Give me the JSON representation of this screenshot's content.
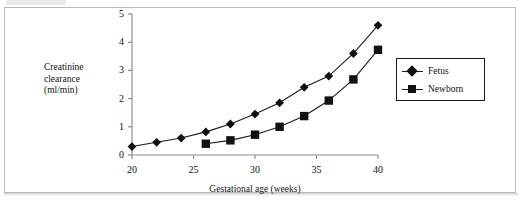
{
  "figure": {
    "top_sliver_text": "",
    "frame_color": "#b9b9b9"
  },
  "chart_data": {
    "type": "line",
    "title": "",
    "subtitle": "",
    "xlabel": "Gestational age (weeks)",
    "ylabel": "Creatinine clearance (ml/min)",
    "ylabel_lines": [
      "Creatinine",
      "clearance",
      "(ml/min)"
    ],
    "xlim": [
      20,
      40
    ],
    "ylim": [
      0,
      5
    ],
    "xticks": [
      20,
      25,
      30,
      35,
      40
    ],
    "xtick_labels": [
      "20",
      "25",
      "30",
      "35",
      "40"
    ],
    "yticks": [
      0,
      1,
      2,
      3,
      4,
      5
    ],
    "ytick_labels": [
      "0",
      "1",
      "2",
      "3",
      "4",
      "5"
    ],
    "grid": false,
    "legend_position": "right",
    "marker_color": "#111111",
    "line_color": "#1b1b1b",
    "axis_color": "#8d8d8d",
    "series": [
      {
        "name": "Fetus",
        "marker": "diamond",
        "x": [
          20,
          22,
          24,
          26,
          28,
          30,
          32,
          34,
          36,
          38,
          40
        ],
        "values": [
          0.3,
          0.45,
          0.6,
          0.82,
          1.1,
          1.45,
          1.85,
          2.4,
          2.8,
          3.6,
          4.6
        ]
      },
      {
        "name": "Newborn",
        "marker": "square",
        "x": [
          26,
          28,
          30,
          32,
          34,
          36,
          38,
          40
        ],
        "values": [
          0.4,
          0.52,
          0.72,
          1.0,
          1.38,
          1.93,
          2.68,
          3.73
        ]
      }
    ]
  },
  "legend": {
    "entries": [
      {
        "label": "Fetus",
        "marker": "diamond"
      },
      {
        "label": "Newborn",
        "marker": "square"
      }
    ]
  }
}
